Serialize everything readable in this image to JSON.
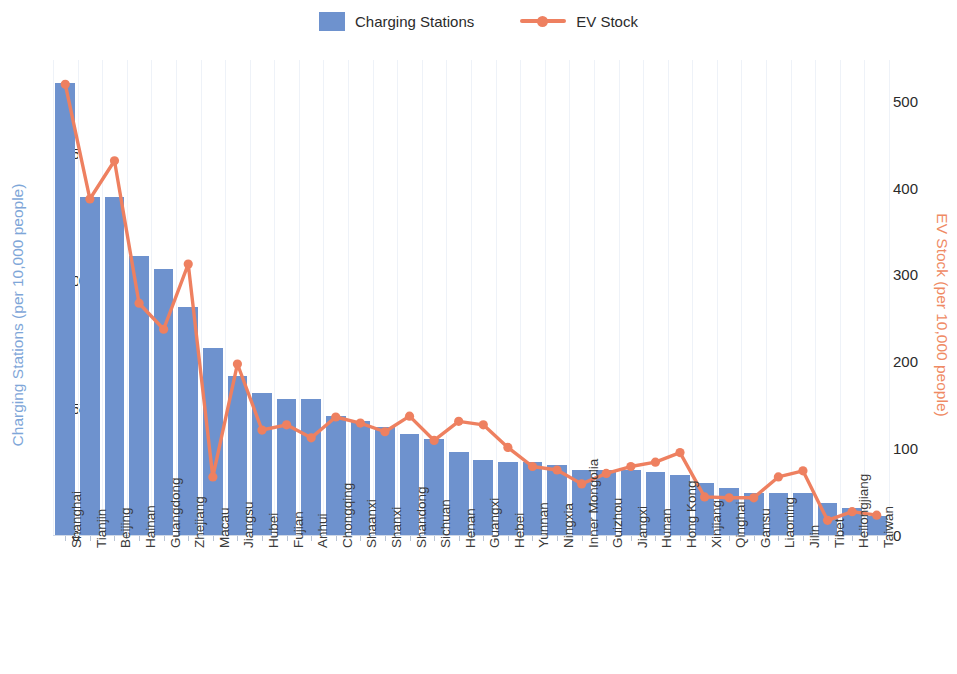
{
  "legend": {
    "items": [
      {
        "label": "Charging Stations",
        "type": "bar",
        "color": "#6e92ce",
        "icon": "square-swatch-icon"
      },
      {
        "label": "EV Stock",
        "type": "line",
        "color": "#ee8060",
        "icon": "line-marker-icon"
      }
    ]
  },
  "axes": {
    "left": {
      "title": "Charging Stations (per 10,000 people)",
      "color": "#7ea6d8",
      "ticks": [
        "0",
        "25",
        "50",
        "75"
      ],
      "tick_values": [
        0,
        25,
        50,
        75
      ],
      "range": [
        0,
        93.5
      ]
    },
    "right": {
      "title": "EV Stock (per 10,000 people)",
      "color": "#ef8a64",
      "ticks": [
        "0",
        "100",
        "200",
        "300",
        "400",
        "500"
      ],
      "tick_values": [
        0,
        100,
        200,
        300,
        400,
        500
      ],
      "range": [
        0,
        548
      ]
    }
  },
  "chart_data": {
    "type": "bar",
    "title": "",
    "subtitle": "",
    "xlabel": "",
    "ylabel": "Charging Stations (per 10,000 people)",
    "y2label": "EV Stock (per 10,000 people)",
    "ylim": [
      0,
      93.5
    ],
    "y2lim": [
      0,
      548
    ],
    "grid": "vertical-light",
    "legend_position": "top-center",
    "categories": [
      "Shanghai",
      "Tianjin",
      "Beijing",
      "Hainan",
      "Guangdong",
      "Zhejiang",
      "Macau",
      "Jiangsu",
      "Hubei",
      "Fujian",
      "Anhui",
      "Chongqing",
      "Shaanxi",
      "Shanxi",
      "Shandong",
      "Sichuan",
      "Henan",
      "Guangxi",
      "Hebei",
      "Yunnan",
      "Ningxia",
      "Inner Mongolia",
      "Guizhou",
      "Jiangxi",
      "Hunan",
      "Hong Kong",
      "Xinjiang",
      "Qinghai",
      "Gansu",
      "Liaoning",
      "Jilin",
      "Tibet",
      "Heilongjiang",
      "Taiwan"
    ],
    "series": [
      {
        "name": "Charging Stations",
        "axis": "left",
        "type": "bar",
        "color": "#6e92ce",
        "unit": "per 10,000 people",
        "values": [
          89.0,
          66.5,
          66.5,
          55.0,
          52.5,
          45.0,
          37.0,
          31.5,
          28.0,
          27.0,
          27.0,
          23.5,
          22.5,
          21.5,
          20.0,
          19.0,
          16.5,
          15.0,
          14.5,
          14.5,
          14.0,
          13.0,
          13.0,
          13.0,
          12.5,
          12.0,
          10.5,
          9.5,
          8.5,
          8.5,
          8.5,
          6.5,
          5.5,
          4.0
        ]
      },
      {
        "name": "EV Stock",
        "axis": "right",
        "type": "line",
        "color": "#ee8060",
        "unit": "per 10,000 people",
        "values": [
          520,
          388,
          432,
          268,
          238,
          313,
          68,
          198,
          122,
          128,
          113,
          137,
          130,
          120,
          138,
          110,
          132,
          128,
          102,
          80,
          76,
          60,
          72,
          80,
          85,
          96,
          45,
          44,
          44,
          68,
          75,
          18,
          28,
          24
        ]
      }
    ]
  }
}
